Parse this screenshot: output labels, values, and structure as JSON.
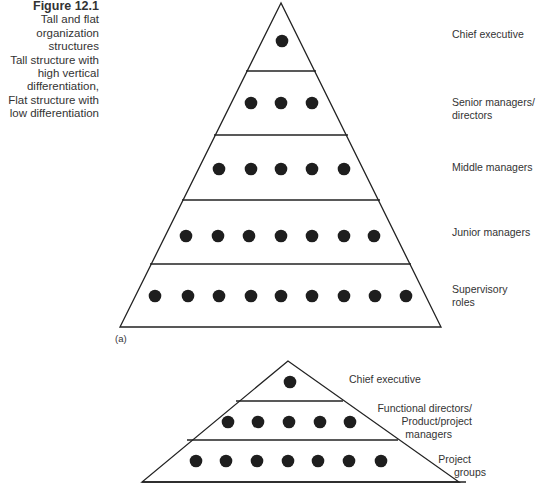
{
  "caption": {
    "figure": "Figure 12.1",
    "lines": [
      "Tall and flat",
      "organization",
      "structures",
      "Tall structure with",
      "high vertical",
      "differentiation,",
      "Flat structure with",
      "low differentiation"
    ]
  },
  "tall_structure": {
    "sublabel": "(a)",
    "levels": [
      {
        "label": "Chief executive",
        "count": 1
      },
      {
        "label_line1": "Senior managers/",
        "label_line2": "directors",
        "count": 3
      },
      {
        "label": "Middle managers",
        "count": 5
      },
      {
        "label": "Junior managers",
        "count": 7
      },
      {
        "label_line1": "Supervisory",
        "label_line2": "roles",
        "count": 9
      }
    ]
  },
  "flat_structure": {
    "levels": [
      {
        "label": "Chief executive",
        "count": 1
      },
      {
        "label_line1": "Functional directors/",
        "label_line2": "Product/project",
        "label_line3": "managers",
        "count": 5
      },
      {
        "label_line1": "Project",
        "label_line2": "groups",
        "count": 7
      }
    ]
  },
  "colors": {
    "line": "#222222",
    "dot": "#1e1e1e",
    "text": "#333333"
  }
}
